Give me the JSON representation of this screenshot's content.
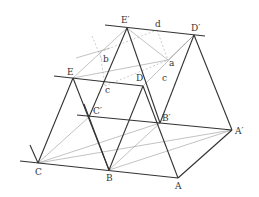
{
  "diagram": {
    "labels": {
      "E_prime": "E′",
      "D_prime": "D′",
      "d": "d",
      "a": "a",
      "b": "b",
      "c_top": "c",
      "c_right": "c",
      "E": "E",
      "D": "D",
      "C_prime": "C′",
      "B_prime": "B′",
      "A_prime": "A′",
      "C": "C",
      "B": "B",
      "A": "A"
    },
    "colors": {
      "heavy_line": "#333333",
      "thin_line": "#999999",
      "dashed_line": "#aaaaaa"
    }
  }
}
